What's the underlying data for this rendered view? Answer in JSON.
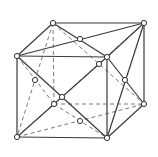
{
  "diagram": {
    "type": "cubic-lattice",
    "colors": {
      "line": "#3a3a3a",
      "dashed": "#6a6a6a",
      "node_fill": "#ffffff",
      "background": "#ffffff"
    },
    "nodes": {
      "front_top_left": [
        17,
        56
      ],
      "front_top_right": [
        107,
        57
      ],
      "front_bottom_left": [
        17,
        137
      ],
      "front_bottom_right": [
        107,
        138
      ],
      "back_top_left": [
        53,
        23
      ],
      "back_top_right": [
        144,
        23
      ],
      "back_bottom_left": [
        54,
        104
      ],
      "back_bottom_right": [
        144,
        104
      ],
      "top_face_center": [
        80,
        39
      ],
      "right_face_center": [
        125,
        80
      ],
      "left_face_center": [
        35,
        80
      ],
      "bottom_face_center": [
        80,
        121
      ],
      "front_face_center": [
        62,
        97
      ],
      "back_face_center": [
        99,
        64
      ]
    }
  }
}
